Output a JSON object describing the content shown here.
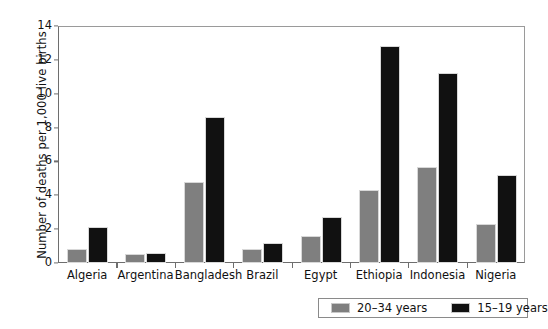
{
  "chart_data": {
    "type": "bar",
    "title": "",
    "xlabel": "",
    "ylabel": "Number of deaths per 1,000 live births",
    "ylim": [
      0,
      14
    ],
    "ytick_values": [
      0,
      2,
      4,
      6,
      8,
      10,
      12,
      14
    ],
    "ytick_labels": [
      "0",
      "2",
      "4",
      "6",
      "8",
      "10",
      "12",
      "14"
    ],
    "grid": false,
    "legend_position": "bottom-right",
    "categories": [
      "Algeria",
      "Argentina",
      "Bangladesh",
      "Brazil",
      "Egypt",
      "Ethiopia",
      "Indonesia",
      "Nigeria"
    ],
    "series": [
      {
        "name": "20–34 years",
        "color": "#7f7f7f",
        "values": [
          0.8,
          0.55,
          4.8,
          0.8,
          1.6,
          4.3,
          5.7,
          2.3
        ]
      },
      {
        "name": "15–19 years",
        "color": "#111111",
        "values": [
          2.1,
          0.6,
          8.65,
          1.2,
          2.7,
          12.8,
          11.2,
          5.2
        ]
      }
    ]
  },
  "legend": {
    "entries": [
      {
        "label": "20–34 years",
        "color": "#7f7f7f"
      },
      {
        "label": "15–19 years",
        "color": "#111111"
      }
    ]
  }
}
